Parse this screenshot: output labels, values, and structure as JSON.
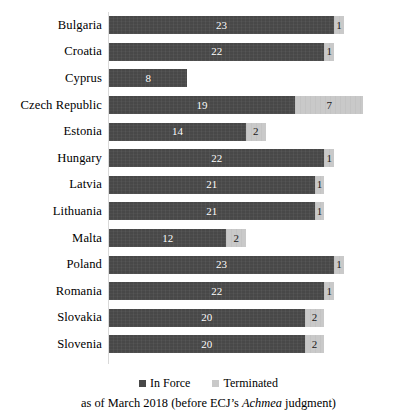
{
  "chart_data": {
    "type": "bar",
    "orientation": "horizontal",
    "stacked": true,
    "title": "",
    "xlabel": "",
    "ylabel": "",
    "xlim": [
      0,
      28
    ],
    "grid": false,
    "legend_position": "bottom",
    "categories": [
      "Bulgaria",
      "Croatia",
      "Cyprus",
      "Czech Republic",
      "Estonia",
      "Hungary",
      "Latvia",
      "Lithuania",
      "Malta",
      "Poland",
      "Romania",
      "Slovakia",
      "Slovenia"
    ],
    "series": [
      {
        "name": "In Force",
        "color": "#484848",
        "values": [
          23,
          22,
          8,
          19,
          14,
          22,
          21,
          21,
          12,
          23,
          22,
          20,
          20
        ]
      },
      {
        "name": "Terminated",
        "color": "#c9c9c9",
        "values": [
          1,
          1,
          0,
          7,
          2,
          1,
          1,
          1,
          2,
          1,
          1,
          2,
          2
        ]
      }
    ],
    "caption": {
      "prefix": "as of March 2018 (before ECJ’s ",
      "italic": "Achmea",
      "suffix": " judgment)"
    }
  },
  "legend": {
    "items": [
      {
        "label": "In Force",
        "swatch": "inforce"
      },
      {
        "label": "Terminated",
        "swatch": "terminated"
      }
    ]
  },
  "caption_text": "as of March 2018 (before ECJ’s Achmea judgment)"
}
